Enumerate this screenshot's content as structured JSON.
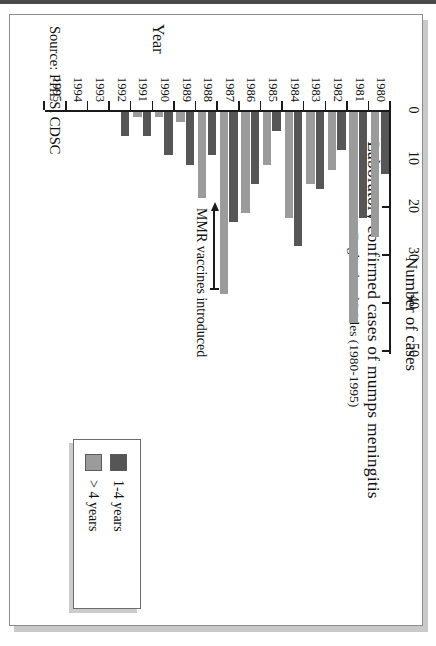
{
  "figure": {
    "title": "Laboratory confirmed cases of mumps meningitis",
    "subtitle": "England and Wales (1980-1995)",
    "source": "Source: PHLS, CDSC",
    "annotation": "MMR vaccines introduced"
  },
  "legend": {
    "entries": [
      {
        "label": "1-4 years",
        "color": "#565656",
        "swatch": "dark"
      },
      {
        "label": "> 4 years",
        "color": "#9b9b9b",
        "swatch": "light"
      }
    ]
  },
  "chart_data": {
    "type": "bar",
    "orientation": "horizontal",
    "title": "Laboratory confirmed cases of mumps meningitis",
    "subtitle": "England and Wales (1980-1995)",
    "xlabel": "Number of cases",
    "ylabel": "Year",
    "xlim": [
      0,
      50
    ],
    "xticks": [
      0,
      10,
      20,
      30,
      40,
      50
    ],
    "xtick_labels": [
      "0",
      "10",
      "20",
      "30",
      "40",
      "50"
    ],
    "grid": false,
    "legend_position": "bottom-right",
    "categories": [
      "1980",
      "1981",
      "1982",
      "1983",
      "1984",
      "1985",
      "1986",
      "1987",
      "1988",
      "1989",
      "1990",
      "1991",
      "1992",
      "1993",
      "1994",
      "1995"
    ],
    "series": [
      {
        "name": "1-4 years",
        "color": "#565656",
        "values": [
          13,
          22,
          8,
          16,
          28,
          4,
          15,
          23,
          9,
          11,
          9,
          5,
          5,
          0,
          0,
          0
        ]
      },
      {
        "name": "> 4 years",
        "color": "#9b9b9b",
        "values": [
          26,
          44,
          12,
          15,
          22,
          11,
          21,
          38,
          18,
          2,
          1,
          1,
          0,
          0,
          0,
          0
        ]
      }
    ],
    "annotations": [
      {
        "text": "MMR vaccines introduced",
        "points_to_category": "1988"
      }
    ]
  }
}
